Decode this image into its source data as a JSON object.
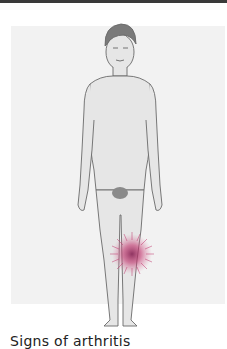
{
  "figure": {
    "highlight_region": "left knee",
    "highlight_color": "#c0306a",
    "skin_color": "#e6e6e6",
    "hair_color": "#7a7a7a",
    "outline_color": "#6a6a6a",
    "background_panel_color": "#f2f2f2"
  },
  "caption": {
    "text": "Signs of arthritis"
  }
}
